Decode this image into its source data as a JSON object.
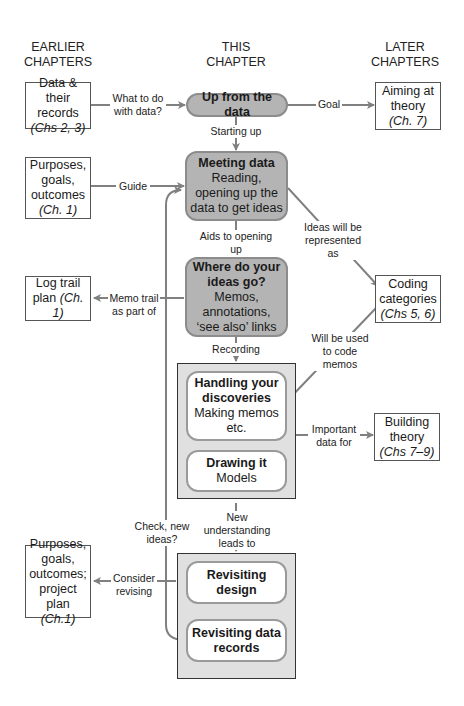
{
  "columns": {
    "earlier": [
      "EARLIER",
      "CHAPTERS"
    ],
    "this": [
      "THIS",
      "CHAPTER"
    ],
    "later": [
      "LATER",
      "CHAPTERS"
    ]
  },
  "left_boxes": [
    {
      "lines": [
        "Data & their",
        "records"
      ],
      "ref": "(Chs 2, 3)"
    },
    {
      "lines": [
        "Purposes,",
        "goals,",
        "outcomes"
      ],
      "ref": "(Ch. 1)"
    },
    {
      "lines": [
        "Log trail"
      ],
      "inline": "plan ",
      "ref": "(Ch. 1)"
    },
    {
      "lines": [
        "Purposes,",
        "goals,",
        "outcomes;",
        "project plan"
      ],
      "ref": "(Ch.1)"
    }
  ],
  "right_boxes": [
    {
      "lines": [
        "Aiming at",
        "theory"
      ],
      "ref": "(Ch. 7)"
    },
    {
      "lines": [
        "Coding",
        "categories"
      ],
      "ref": "(Chs 5, 6)"
    },
    {
      "lines": [
        "Building",
        "theory"
      ],
      "ref": "(Chs 7–9)"
    }
  ],
  "center_pills": [
    {
      "title": "Up from the data",
      "body": []
    },
    {
      "title": "Meeting data",
      "body": [
        "Reading,",
        "opening up the",
        "data to get ideas"
      ]
    },
    {
      "title": "Where do your",
      "title2": "ideas go?",
      "body": [
        "Memos,",
        "annotations,",
        "‘see also’ links"
      ]
    }
  ],
  "group1": [
    {
      "title": [
        "Handling your",
        "discoveries"
      ],
      "body": [
        "Making memos",
        "etc."
      ]
    },
    {
      "title": [
        "Drawing it"
      ],
      "body": [
        "Models"
      ]
    }
  ],
  "group2": [
    {
      "title": [
        "Revisiting",
        "design"
      ],
      "body": []
    },
    {
      "title": [
        "Revisiting data",
        "records"
      ],
      "body": []
    }
  ],
  "labels": {
    "what_to_do": [
      "What to do",
      "with data?"
    ],
    "goal": "Goal",
    "starting_up": "Starting up",
    "guide": "Guide",
    "ideas_represented": [
      "Ideas will be",
      "represented as"
    ],
    "aids": "Aids to opening up",
    "memo_trail": [
      "Memo trail",
      "as part of"
    ],
    "will_be_used": [
      "Will be used",
      "to code",
      "memos"
    ],
    "recording": "Recording",
    "important": [
      "Important",
      "data for"
    ],
    "new_understanding": [
      "New understanding",
      "leads to"
    ],
    "check_new": [
      "Check, new",
      "ideas?"
    ],
    "consider": [
      "Consider",
      "revising"
    ]
  },
  "colors": {
    "pill_fill": "#b4b4b4",
    "group_fill": "#e0e0e0",
    "arrow": "#808080"
  }
}
